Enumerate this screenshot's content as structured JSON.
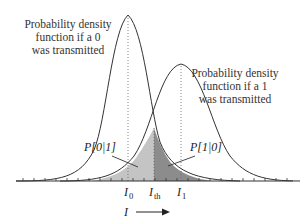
{
  "diagram": {
    "type": "probability-density-overlap",
    "curve_0": {
      "label_lines": [
        "Probability density",
        "function if a 0",
        "was transmitted"
      ],
      "mean_label": "I",
      "mean_sub": "0"
    },
    "curve_1": {
      "label_lines": [
        "Probability density",
        "function if a 1",
        "was transmitted"
      ],
      "mean_label": "I",
      "mean_sub": "1"
    },
    "threshold": {
      "label": "I",
      "sub": "th"
    },
    "error_regions": [
      {
        "label": "P[0|1]",
        "fill": "#c4c4c4"
      },
      {
        "label": "P[1|0]",
        "fill": "#8c8c8c"
      }
    ],
    "axis": {
      "label": "I",
      "arrow": "right"
    },
    "colors": {
      "curve": "#333333",
      "axis": "#333333",
      "region_light": "#c4c4c4",
      "region_dark": "#8c8c8c",
      "dotted": "#666666"
    }
  }
}
